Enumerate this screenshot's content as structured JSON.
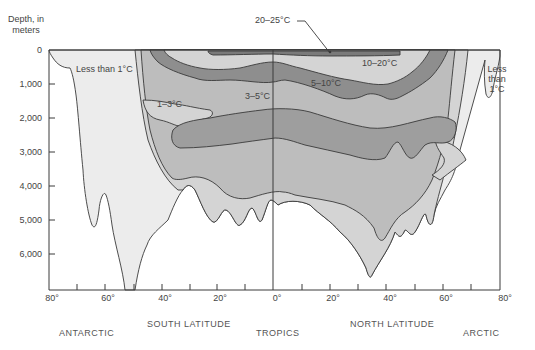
{
  "diagram": {
    "type": "ocean temperature cross-section by latitude and depth",
    "y_axis": {
      "title": "Depth, in meters",
      "ticks": [
        "0",
        "1,000",
        "2,000",
        "3,000",
        "4,000",
        "5,000",
        "6,000"
      ]
    },
    "x_axis": {
      "ticks": [
        "80°",
        "60°",
        "40°",
        "20°",
        "0°",
        "20°",
        "40°",
        "60°",
        "80°"
      ],
      "region_labels": {
        "antarctic": "ANTARCTIC",
        "south_latitude": "SOUTH LATITUDE",
        "tropics": "TROPICS",
        "north_latitude": "NORTH LATITUDE",
        "arctic": "ARCTIC"
      }
    },
    "zones": {
      "less_than_1_south": "Less than 1°C",
      "less_than_1_north": [
        "Less",
        "than",
        "1°C"
      ],
      "z1_3": "1–3°C",
      "z3_5": "3–5°C",
      "z5_10": "5–10°C",
      "z10_20": "10–20°C",
      "z20_25": "20–25°C"
    },
    "colors": {
      "less_than_1": "#ececec",
      "z1_3": "#d4d4d4",
      "z3_5": "#bdbdbd",
      "z5_10": "#8e8e8e",
      "z10_20": "#d4d4d4",
      "z20_25": "#7a7a7a",
      "outline": "#3a3a3a"
    }
  }
}
